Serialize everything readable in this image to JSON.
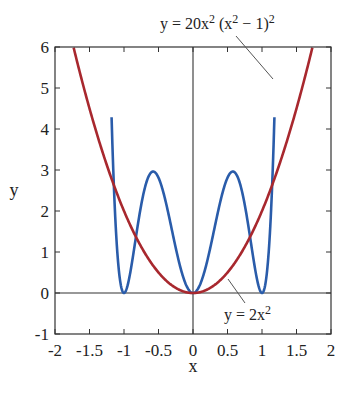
{
  "chart_data": {
    "type": "line",
    "title": "",
    "xlabel": "x",
    "ylabel": "y",
    "xlim": [
      -2,
      2
    ],
    "ylim": [
      -1,
      6
    ],
    "xticks": [
      -2,
      -1.5,
      -1,
      -0.5,
      0,
      0.5,
      1,
      1.5,
      2
    ],
    "xtick_labels": [
      "-2",
      "-1.5",
      "-1",
      "-0.5",
      "0",
      "0.5",
      "1",
      "1.5",
      "2"
    ],
    "yticks": [
      -1,
      0,
      1,
      2,
      3,
      4,
      5,
      6
    ],
    "ytick_labels": [
      "-1",
      "0",
      "1",
      "2",
      "3",
      "4",
      "5",
      "6"
    ],
    "grid": false,
    "legend": "none (inline annotations)",
    "reference_lines": [
      "x = 0",
      "y = 0"
    ],
    "series": [
      {
        "name": "y = 20x^2 (x^2 - 1)^2",
        "color": "#2a5caa",
        "formula": "20*x^2*(x^2-1)^2",
        "x": [
          -1.18,
          -1.1,
          -1.0,
          -0.9,
          -0.8,
          -0.7,
          -0.577,
          -0.5,
          -0.4,
          -0.3,
          -0.2,
          -0.1,
          0,
          0.1,
          0.2,
          0.3,
          0.4,
          0.5,
          0.577,
          0.7,
          0.8,
          0.9,
          1.0,
          1.1,
          1.18
        ],
        "y": [
          6.0,
          1.07,
          0,
          0.58,
          1.66,
          2.55,
          2.96,
          2.81,
          2.26,
          1.49,
          0.74,
          0.2,
          0,
          0.2,
          0.74,
          1.49,
          2.26,
          2.81,
          2.96,
          2.55,
          1.66,
          0.58,
          0,
          1.07,
          6.0
        ]
      },
      {
        "name": "y = 2x^2",
        "color": "#a8282e",
        "formula": "2*x^2",
        "x": [
          -1.73,
          -1.5,
          -1.0,
          -0.5,
          0,
          0.5,
          1.0,
          1.5,
          1.73
        ],
        "y": [
          6.0,
          4.5,
          2.0,
          0.5,
          0,
          0.5,
          2.0,
          4.5,
          6.0
        ]
      }
    ],
    "annotations": [
      {
        "text": "y = 20x² (x² − 1)²",
        "points_to_series": "y = 20x^2 (x^2 - 1)^2"
      },
      {
        "text": "y = 2x²",
        "points_to_series": "y = 2x^2"
      }
    ]
  },
  "labels": {
    "xlabel": "x",
    "ylabel": "y",
    "ann_quartic_a": "y = 20x",
    "ann_quartic_sup1": "2",
    "ann_quartic_b": " (x",
    "ann_quartic_sup2": "2",
    "ann_quartic_c": " − 1)",
    "ann_quartic_sup3": "2",
    "ann_quad_a": "y = 2x",
    "ann_quad_sup": "2"
  }
}
